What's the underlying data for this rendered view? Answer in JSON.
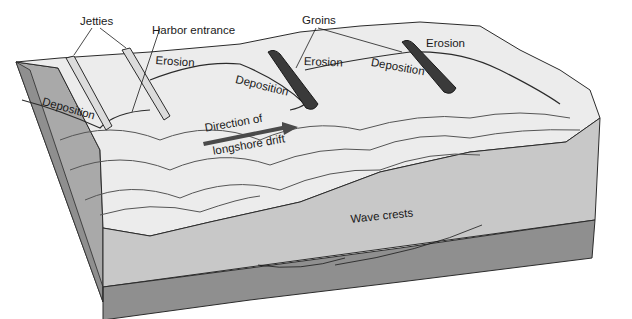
{
  "diagram": {
    "labels": {
      "jetties": "Jetties",
      "harbor_entrance": "Harbor entrance",
      "groins": "Groins",
      "erosion_1": "Erosion",
      "erosion_2": "Erosion",
      "erosion_3": "Erosion",
      "deposition_1": "Deposition",
      "deposition_2": "Deposition",
      "deposition_3": "Deposition",
      "drift_line1": "Direction of",
      "drift_line2": "longshore drift",
      "wave_crests": "Wave crests"
    },
    "colors": {
      "beach": "#e9e9e9",
      "beach_shade": "#d2d2d2",
      "water_face": "#c9c9c9",
      "bedrock": "#8f8f8f",
      "outline": "#2b2b2b",
      "groin": "#3a3a3a",
      "arrow": "#4a4a4a",
      "jetty": "#dcdcdc"
    }
  }
}
